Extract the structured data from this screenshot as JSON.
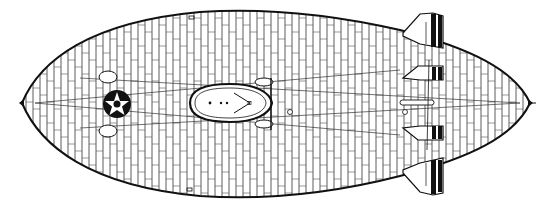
{
  "figure": {
    "title": "Airship top-view line drawing",
    "view": "plan (top) view"
  },
  "colors": {
    "background": "#ffffff",
    "ink": "#111111",
    "panel_lines": "#333333"
  },
  "parts": {
    "hull": "hull",
    "gondola": "control-car",
    "insignia": "star-roundel",
    "upper_fin": "upper-tail-fin",
    "lower_fin": "lower-tail-fin",
    "port_fin": "port-stabilizer",
    "starboard_fin": "starboard-stabilizer",
    "engine_cars": "engine-nacelles",
    "nose_cap": "nose-mooring-point",
    "tail_tip": "tail-tip"
  }
}
